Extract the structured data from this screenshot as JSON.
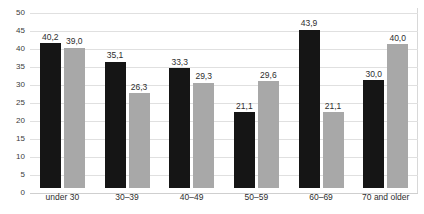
{
  "chart_data": {
    "type": "bar",
    "title": "",
    "subtitle": "",
    "xlabel": "",
    "ylabel": "",
    "ylim": [
      0,
      50
    ],
    "ytick_step": 5,
    "yticks": [
      "50",
      "45",
      "40",
      "35",
      "30",
      "25",
      "20",
      "15",
      "10",
      "5",
      "0"
    ],
    "grid": true,
    "legend": "none",
    "decimal_separator": ",",
    "categories": [
      "under 30",
      "30–39",
      "40–49",
      "50–59",
      "60–69",
      "70 and older"
    ],
    "series": [
      {
        "name": "series-dark",
        "color": "#151515",
        "values": [
          40.2,
          35.1,
          33.3,
          21.1,
          43.9,
          30.0
        ],
        "labels": [
          "40,2",
          "35,1",
          "33,3",
          "21,1",
          "43,9",
          "30,0"
        ]
      },
      {
        "name": "series-gray",
        "color": "#a8a8a8",
        "values": [
          39.0,
          26.3,
          29.3,
          29.6,
          21.1,
          40.0
        ],
        "labels": [
          "39,0",
          "26,3",
          "29,3",
          "29,6",
          "21,1",
          "40,0"
        ]
      }
    ]
  },
  "colors": {
    "series_dark": "#151515",
    "series_gray": "#a8a8a8",
    "gridline": "#e0e0e0",
    "axis": "#d8d8d8",
    "text": "#2e2e2e",
    "background": "#ffffff"
  }
}
